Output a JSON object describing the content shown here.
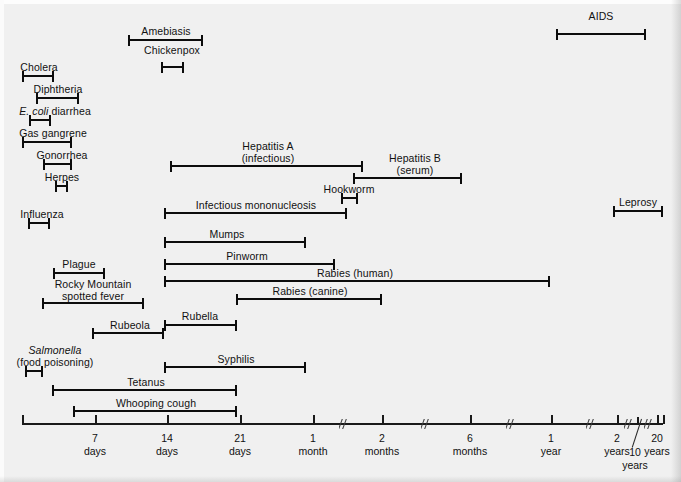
{
  "figure": {
    "type": "range-chart",
    "title": "",
    "background_color": "#f0f0f0",
    "bar_color": "#0c0c0c",
    "axis": {
      "label_prefix": "",
      "ticks": [
        {
          "value": "7",
          "unit": "days",
          "x": 95
        },
        {
          "value": "14",
          "unit": "days",
          "x": 167
        },
        {
          "value": "21",
          "unit": "days",
          "x": 240
        },
        {
          "value": "1",
          "unit": "month",
          "x": 313
        },
        {
          "value": "2",
          "unit": "months",
          "x": 382
        },
        {
          "value": "6",
          "unit": "months",
          "x": 470
        },
        {
          "value": "1",
          "unit": "year",
          "x": 551
        },
        {
          "value": "2",
          "unit": "years",
          "x": 617
        },
        {
          "value": "10",
          "unit": "years",
          "x": 637
        },
        {
          "value": "20",
          "unit": "years",
          "x": 657
        }
      ],
      "breaks_x": [
        343,
        425,
        510,
        590,
        628,
        648
      ],
      "start_x": 22,
      "end_x": 663,
      "y": 423
    },
    "bars": [
      {
        "name": "AIDS",
        "label": "AIDS",
        "label_lines": [
          "AIDS"
        ],
        "x1": 556,
        "x2": 646,
        "y": 33,
        "label_cx": 601,
        "label_y": 11
      },
      {
        "name": "Amebiasis",
        "label": "Amebiasis",
        "label_lines": [
          "Amebiasis"
        ],
        "x1": 128,
        "x2": 203,
        "y": 39,
        "label_cx": 166,
        "label_y": 26
      },
      {
        "name": "Chickenpox",
        "label": "Chickenpox",
        "label_lines": [
          "Chickenpox"
        ],
        "x1": 161,
        "x2": 184,
        "y": 66,
        "label_cx": 172,
        "label_y": 45
      },
      {
        "name": "Cholera",
        "label": "Cholera",
        "label_lines": [
          "Cholera"
        ],
        "x1": 22,
        "x2": 54,
        "y": 75,
        "label_cx": 39,
        "label_y": 62
      },
      {
        "name": "Diphtheria",
        "label": "Diphtheria",
        "label_lines": [
          "Diphtheria"
        ],
        "x1": 36,
        "x2": 79,
        "y": 97,
        "label_cx": 58,
        "label_y": 84
      },
      {
        "name": "E. coli diarrhea",
        "label": "E. coli diarrhea",
        "label_lines": [
          "E. coli diarrhea"
        ],
        "italic_prefix": "E. coli",
        "x1": 29,
        "x2": 51,
        "y": 119,
        "label_cx": 55,
        "label_y": 106
      },
      {
        "name": "Gas gangrene",
        "label": "Gas gangrene",
        "label_lines": [
          "Gas gangrene"
        ],
        "x1": 22,
        "x2": 72,
        "y": 141,
        "label_cx": 53,
        "label_y": 128
      },
      {
        "name": "Gonorrhea",
        "label": "Gonorrhea",
        "label_lines": [
          "Gonorrhea"
        ],
        "x1": 43,
        "x2": 72,
        "y": 163,
        "label_cx": 62,
        "label_y": 150
      },
      {
        "name": "Hepatitis A (infectious)",
        "label": "Hepatitis A (infectious)",
        "label_lines": [
          "Hepatitis A",
          "(infectious)"
        ],
        "x1": 170,
        "x2": 363,
        "y": 165,
        "label_cx": 268,
        "label_y": 141
      },
      {
        "name": "Herpes",
        "label": "Herpes",
        "label_lines": [
          "Herpes"
        ],
        "x1": 55,
        "x2": 68,
        "y": 185,
        "label_cx": 62,
        "label_y": 172
      },
      {
        "name": "Hepatitis B (serum)",
        "label": "Hepatitis B (serum)",
        "label_lines": [
          "Hepatitis B",
          "(serum)"
        ],
        "x1": 353,
        "x2": 462,
        "y": 177,
        "label_cx": 415,
        "label_y": 153
      },
      {
        "name": "Hookworm",
        "label": "Hookworm",
        "label_lines": [
          "Hookworm"
        ],
        "x1": 341,
        "x2": 358,
        "y": 197,
        "label_cx": 349,
        "label_y": 184
      },
      {
        "name": "Influenza",
        "label": "Influenza",
        "label_lines": [
          "Influenza"
        ],
        "x1": 28,
        "x2": 50,
        "y": 222,
        "label_cx": 42,
        "label_y": 209
      },
      {
        "name": "Leprosy",
        "label": "Leprosy",
        "label_lines": [
          "Leprosy"
        ],
        "x1": 613,
        "x2": 663,
        "y": 210,
        "label_cx": 638,
        "label_y": 197
      },
      {
        "name": "Infectious mononucleosis",
        "label": "Infectious mononucleosis",
        "label_lines": [
          "Infectious mononucleosis"
        ],
        "x1": 164,
        "x2": 347,
        "y": 212,
        "label_cx": 256,
        "label_y": 200
      },
      {
        "name": "Mumps",
        "label": "Mumps",
        "label_lines": [
          "Mumps"
        ],
        "x1": 164,
        "x2": 306,
        "y": 241,
        "label_cx": 227,
        "label_y": 229
      },
      {
        "name": "Pinworm",
        "label": "Pinworm",
        "label_lines": [
          "Pinworm"
        ],
        "x1": 164,
        "x2": 335,
        "y": 263,
        "label_cx": 247,
        "label_y": 251
      },
      {
        "name": "Plague",
        "label": "Plague",
        "label_lines": [
          "Plague"
        ],
        "x1": 53,
        "x2": 105,
        "y": 272,
        "label_cx": 79,
        "label_y": 259
      },
      {
        "name": "Rabies (human)",
        "label": "Rabies (human)",
        "label_lines": [
          "Rabies (human)"
        ],
        "x1": 164,
        "x2": 550,
        "y": 280,
        "label_cx": 355,
        "label_y": 268
      },
      {
        "name": "Rocky Mountain spotted fever",
        "label": "Rocky Mountain spotted fever",
        "label_lines": [
          "Rocky Mountain",
          "spotted fever"
        ],
        "x1": 42,
        "x2": 144,
        "y": 302,
        "label_cx": 93,
        "label_y": 279
      },
      {
        "name": "Rabies (canine)",
        "label": "Rabies (canine)",
        "label_lines": [
          "Rabies (canine)"
        ],
        "x1": 236,
        "x2": 382,
        "y": 298,
        "label_cx": 310,
        "label_y": 286
      },
      {
        "name": "Rubella",
        "label": "Rubella",
        "label_lines": [
          "Rubella"
        ],
        "x1": 164,
        "x2": 237,
        "y": 324,
        "label_cx": 200,
        "label_y": 311
      },
      {
        "name": "Rubeola",
        "label": "Rubeola",
        "label_lines": [
          "Rubeola"
        ],
        "x1": 92,
        "x2": 164,
        "y": 332,
        "label_cx": 130,
        "label_y": 320
      },
      {
        "name": "Salmonella (food poisoning)",
        "label": "Salmonella (food poisoning)",
        "label_lines": [
          "Salmonella",
          "(food poisoning)"
        ],
        "italic_prefix": "Salmonella",
        "x1": 25,
        "x2": 43,
        "y": 370,
        "label_cx": 55,
        "label_y": 345
      },
      {
        "name": "Syphilis",
        "label": "Syphilis",
        "label_lines": [
          "Syphilis"
        ],
        "x1": 164,
        "x2": 306,
        "y": 366,
        "label_cx": 236,
        "label_y": 354
      },
      {
        "name": "Tetanus",
        "label": "Tetanus",
        "label_lines": [
          "Tetanus"
        ],
        "x1": 52,
        "x2": 237,
        "y": 389,
        "label_cx": 146,
        "label_y": 377
      },
      {
        "name": "Whooping cough",
        "label": "Whooping cough",
        "label_lines": [
          "Whooping cough"
        ],
        "x1": 73,
        "x2": 237,
        "y": 410,
        "label_cx": 156,
        "label_y": 398
      }
    ]
  },
  "chart_data": {
    "type": "bar",
    "xlabel": "Incubation period",
    "ylabel": "",
    "axis_tick_labels": [
      "7 days",
      "14 days",
      "21 days",
      "1 month",
      "2 months",
      "6 months",
      "1 year",
      "2 years",
      "10 years",
      "20 years"
    ],
    "grid": false,
    "legend": "none",
    "categories": [
      "AIDS",
      "Amebiasis",
      "Chickenpox",
      "Cholera",
      "Diphtheria",
      "E. coli diarrhea",
      "Gas gangrene",
      "Gonorrhea",
      "Hepatitis A (infectious)",
      "Herpes",
      "Hepatitis B (serum)",
      "Hookworm",
      "Influenza",
      "Leprosy",
      "Infectious mononucleosis",
      "Mumps",
      "Pinworm",
      "Plague",
      "Rabies (human)",
      "Rocky Mountain spotted fever",
      "Rabies (canine)",
      "Rubella",
      "Rubeola",
      "Salmonella (food poisoning)",
      "Syphilis",
      "Tetanus",
      "Whooping cough"
    ],
    "ranges": [
      {
        "category": "AIDS",
        "low": "1 year",
        "high": "10 years"
      },
      {
        "category": "Amebiasis",
        "low": "11 days",
        "high": "18 days"
      },
      {
        "category": "Chickenpox",
        "low": "14 days",
        "high": "16 days"
      },
      {
        "category": "Cholera",
        "low": "0 days",
        "high": "7 days"
      },
      {
        "category": "Diphtheria",
        "low": "1 day",
        "high": "5 days"
      },
      {
        "category": "E. coli diarrhea",
        "low": "1 day",
        "high": "3 days"
      },
      {
        "category": "Gas gangrene",
        "low": "0 days",
        "high": "5 days"
      },
      {
        "category": "Gonorrhea",
        "low": "2 days",
        "high": "5 days"
      },
      {
        "category": "Hepatitis A (infectious)",
        "low": "15 days",
        "high": "50 days"
      },
      {
        "category": "Herpes",
        "low": "3 days",
        "high": "4 days"
      },
      {
        "category": "Hepatitis B (serum)",
        "low": "45 days",
        "high": "5 months"
      },
      {
        "category": "Hookworm",
        "low": "1.2 months",
        "high": "1.4 months"
      },
      {
        "category": "Influenza",
        "low": "1 day",
        "high": "3 days"
      },
      {
        "category": "Leprosy",
        "low": "1.5 years",
        "high": "20 years"
      },
      {
        "category": "Infectious mononucleosis",
        "low": "14 days",
        "high": "1.4 months"
      },
      {
        "category": "Mumps",
        "low": "14 days",
        "high": "24 days"
      },
      {
        "category": "Pinworm",
        "low": "14 days",
        "high": "1.1 months"
      },
      {
        "category": "Plague",
        "low": "2 days",
        "high": "7 days"
      },
      {
        "category": "Rabies (human)",
        "low": "14 days",
        "high": "1 year"
      },
      {
        "category": "Rocky Mountain spotted fever",
        "low": "1 day",
        "high": "12 days"
      },
      {
        "category": "Rabies (canine)",
        "low": "21 days",
        "high": "2 months"
      },
      {
        "category": "Rubella",
        "low": "14 days",
        "high": "21 days"
      },
      {
        "category": "Rubeola",
        "low": "7 days",
        "high": "14 days"
      },
      {
        "category": "Salmonella (food poisoning)",
        "low": "0 days",
        "high": "2 days"
      },
      {
        "category": "Syphilis",
        "low": "14 days",
        "high": "1 month"
      },
      {
        "category": "Tetanus",
        "low": "3 days",
        "high": "21 days"
      },
      {
        "category": "Whooping cough",
        "low": "5 days",
        "high": "21 days"
      }
    ]
  }
}
